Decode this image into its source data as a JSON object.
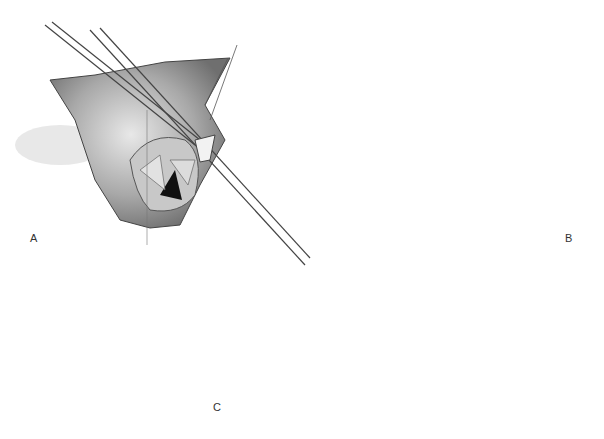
{
  "figure": {
    "panels": [
      {
        "id": "A",
        "label": "A",
        "description": "Surgical view with forceps/instruments inserted into opened cardiac chamber exposing valve leaflets"
      },
      {
        "id": "B",
        "label": "B",
        "description": "Circular magnified view of opened chamber with valve leaflets and row of pledgeted sutures along margin; retraction sutures"
      },
      {
        "id": "C",
        "label": "C",
        "description": "Closed incision with continuous suture line on heart surface"
      }
    ],
    "colors": {
      "background": "#ffffff",
      "line": "#333333",
      "shade_dark": "#555555",
      "shade_mid": "#9a9a9a",
      "shade_light": "#d6d6d6"
    }
  }
}
